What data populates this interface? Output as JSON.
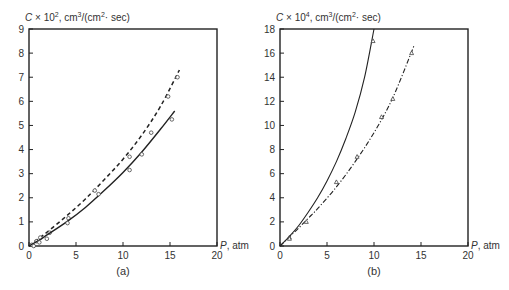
{
  "chart_data": [
    {
      "id": "a",
      "type": "line",
      "panel_label": "(a)",
      "ylabel": "C × 10², cm³/(cm²· sec)",
      "ylabel_parts": {
        "prefix": "C × 10",
        "exp": "2",
        "unit1": ", cm",
        "unit1_exp": "3",
        "unit2": "/(cm",
        "unit2_exp": "2",
        "unit3": "· sec)"
      },
      "xlabel": "P, atm",
      "xlim": [
        0,
        20
      ],
      "ylim": [
        0,
        9
      ],
      "xticks": [
        0,
        5,
        10,
        15,
        20
      ],
      "yticks": [
        0,
        1,
        2,
        3,
        4,
        5,
        6,
        7,
        8,
        9
      ],
      "grid": false,
      "series": [
        {
          "name": "dashed curve",
          "style": "dashed",
          "marker": "circle",
          "curve": {
            "x": [
              0,
              1,
              2,
              4,
              6,
              8,
              10,
              12,
              14,
              16
            ],
            "y": [
              0,
              0.3,
              0.6,
              1.25,
              1.95,
              2.75,
              3.6,
              4.6,
              5.8,
              7.3
            ]
          },
          "points": {
            "x": [
              0.3,
              0.8,
              1.2,
              2.2,
              4.2,
              7.0,
              10.7,
              13.0,
              14.8,
              15.8
            ],
            "y": [
              0.05,
              0.2,
              0.35,
              0.55,
              1.15,
              2.3,
              3.7,
              4.7,
              6.2,
              7.0
            ]
          }
        },
        {
          "name": "solid curve",
          "style": "solid",
          "marker": "circle",
          "curve": {
            "x": [
              0,
              1,
              2,
              4,
              6,
              8,
              10,
              12,
              14,
              15.5
            ],
            "y": [
              0,
              0.22,
              0.48,
              1.0,
              1.6,
              2.3,
              3.05,
              3.9,
              4.85,
              5.6
            ]
          },
          "points": {
            "x": [
              0.5,
              1.1,
              1.9,
              4.1,
              7.4,
              10.7,
              12.0,
              15.2
            ],
            "y": [
              0.0,
              0.15,
              0.3,
              0.95,
              2.15,
              3.15,
              3.8,
              5.25
            ]
          }
        }
      ]
    },
    {
      "id": "b",
      "type": "line",
      "panel_label": "(b)",
      "ylabel": "C × 10⁴, cm³/(cm²· sec)",
      "ylabel_parts": {
        "prefix": "C × 10",
        "exp": "4",
        "unit1": ", cm",
        "unit1_exp": "3",
        "unit2": "/(cm",
        "unit2_exp": "2",
        "unit3": "· sec)"
      },
      "xlabel": "P, atm",
      "xlim": [
        0,
        20
      ],
      "ylim": [
        0,
        18
      ],
      "xticks": [
        0,
        5,
        10,
        15,
        20
      ],
      "yticks": [
        0,
        2,
        4,
        6,
        8,
        10,
        12,
        14,
        16,
        18
      ],
      "grid": false,
      "series": [
        {
          "name": "solid curve",
          "style": "solid",
          "marker": "triangle",
          "curve": {
            "x": [
              0,
              1,
              2,
              3,
              4,
              5,
              6,
              7,
              8,
              9,
              10
            ],
            "y": [
              0,
              0.8,
              1.7,
              2.8,
              4.0,
              5.4,
              7.0,
              8.9,
              11.1,
              14.0,
              18.0
            ]
          },
          "points": {
            "x": [
              1.0,
              9.9
            ],
            "y": [
              0.7,
              17.0
            ]
          }
        },
        {
          "name": "dash-dot curve",
          "style": "dashdot",
          "marker": "triangle",
          "curve": {
            "x": [
              0,
              1,
              2,
              3,
              4,
              6,
              8,
              10,
              12,
              14.3
            ],
            "y": [
              0,
              0.75,
              1.5,
              2.3,
              3.1,
              4.9,
              7.0,
              9.4,
              12.3,
              16.7
            ]
          },
          "points": {
            "x": [
              1.0,
              2.8,
              6.0,
              8.2,
              10.8,
              12.0,
              14.0
            ],
            "y": [
              0.6,
              2.0,
              5.3,
              7.4,
              10.7,
              12.2,
              16.0
            ]
          }
        }
      ]
    }
  ],
  "panels": {
    "a": {
      "label": "(a)",
      "xlabel": "P, atm"
    },
    "b": {
      "label": "(b)",
      "xlabel": "P, atm"
    }
  }
}
